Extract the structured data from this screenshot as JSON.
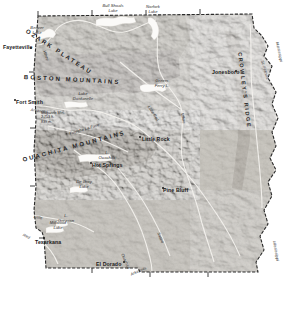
{
  "map": {
    "title": "Arkansas Topography",
    "state_name": "Arkansas",
    "cities": [
      {
        "name": "Fayetteville",
        "x": 3,
        "y": 45,
        "dot_x": 30,
        "dot_y": 47
      },
      {
        "name": "Fort Smith",
        "x": 16,
        "y": 100,
        "dot_x": 14,
        "dot_y": 99
      },
      {
        "name": "Jonesboro",
        "x": 212,
        "y": 70,
        "dot_x": 235,
        "dot_y": 70
      },
      {
        "name": "Little Rock",
        "x": 142,
        "y": 137,
        "dot_x": 139,
        "dot_y": 136
      },
      {
        "name": "Hot Springs",
        "x": 92,
        "y": 163,
        "dot_x": 90,
        "dot_y": 162
      },
      {
        "name": "Pine Bluff",
        "x": 163,
        "y": 188,
        "dot_x": 162,
        "dot_y": 187
      },
      {
        "name": "Texarkana",
        "x": 35,
        "y": 240,
        "dot_x": 43,
        "dot_y": 237
      },
      {
        "name": "El Dorado",
        "x": 96,
        "y": 262,
        "dot_x": 123,
        "dot_y": 261
      }
    ],
    "regions": [
      {
        "name": "OZARK PLATEAU",
        "x": 28,
        "y": 28,
        "rot": 33,
        "size": "lg"
      },
      {
        "name": "BOSTON MOUNTAINS",
        "x": 24,
        "y": 74,
        "rot": 3,
        "size": "lg"
      },
      {
        "name": "OUACHITA MOUNTAINS",
        "x": 22,
        "y": 157,
        "rot": -15,
        "size": "lg"
      },
      {
        "name": "CROWLEY'S RIDGE",
        "x": 242,
        "y": 52,
        "rot": 83,
        "size": "sm"
      }
    ],
    "lakes": [
      {
        "name": "Bull Shoals\nLake",
        "x": 96,
        "y": 4,
        "w": 34
      },
      {
        "name": "Norfork\nLake",
        "x": 140,
        "y": 5,
        "w": 26
      },
      {
        "name": "Beaver\nLake",
        "x": 24,
        "y": 26,
        "w": 26
      },
      {
        "name": "Lake\nDardanelle",
        "x": 66,
        "y": 92,
        "w": 34
      },
      {
        "name": "Greers\nFerry L.",
        "x": 148,
        "y": 79,
        "w": 28
      },
      {
        "name": "L.\nOuachita",
        "x": 95,
        "y": 151,
        "w": 24
      },
      {
        "name": "De Gray\nLake",
        "x": 72,
        "y": 180,
        "w": 24
      },
      {
        "name": "L.\nGreeson",
        "x": 56,
        "y": 214,
        "w": 20
      },
      {
        "name": "Millwood\nLake",
        "x": 44,
        "y": 221,
        "w": 28
      }
    ],
    "rivers": [
      {
        "name": "White",
        "x": 46,
        "y": 50,
        "rot": 72
      },
      {
        "name": "White",
        "x": 184,
        "y": 113,
        "rot": 80
      },
      {
        "name": "Arkansas",
        "x": 31,
        "y": 108,
        "rot": 8
      },
      {
        "name": "Arkansas",
        "x": 130,
        "y": 273,
        "rot": -25
      },
      {
        "name": "Fourche La Fave",
        "x": 69,
        "y": 132,
        "rot": -17
      },
      {
        "name": "Little Red",
        "x": 150,
        "y": 105,
        "rot": 57
      },
      {
        "name": "St. Francis",
        "x": 264,
        "y": 60,
        "rot": 74
      },
      {
        "name": "Mississippi",
        "x": 279,
        "y": 42,
        "rot": 78
      },
      {
        "name": "Mississippi",
        "x": 276,
        "y": 241,
        "rot": 80
      },
      {
        "name": "Ouachita",
        "x": 124,
        "y": 253,
        "rot": 67
      },
      {
        "name": "Saline",
        "x": 160,
        "y": 232,
        "rot": 68
      },
      {
        "name": "Red",
        "x": 24,
        "y": 233,
        "rot": 28
      },
      {
        "name": "Little",
        "x": 34,
        "y": 215,
        "rot": 8
      }
    ],
    "peak": {
      "name": "Magazine Mtn.",
      "elev_ft": "2,753 ft.",
      "elev_m": "839 m.",
      "x": 41,
      "y": 111
    }
  },
  "legend": {
    "title": "TOPOGRAPHY",
    "below_sea_level": "Below\nsea\nlevel",
    "sea_level": "Sea\nLevel",
    "steps": [
      {
        "m": "100 m.",
        "ft": "328 ft.",
        "color": "#d8d5cf",
        "w": 20
      },
      {
        "m": "200 m.",
        "ft": "656 ft.",
        "color": "#c6c2ba",
        "w": 20
      },
      {
        "m": "500 m.",
        "ft": "1,640 ft.",
        "color": "#b2ada3",
        "w": 20
      },
      {
        "m": "1,000 m.",
        "ft": "3,281 ft.",
        "color": "#9d978c",
        "w": 20
      },
      {
        "m": "2,000 m.",
        "ft": "6,562 ft.",
        "color": "#857f74",
        "w": 20
      },
      {
        "m": "3,000 m.",
        "ft": "10,000 ft.",
        "color": "#6e685e",
        "w": 20
      }
    ]
  },
  "colors": {
    "lowland": "#b8b4ac",
    "upland": "#9a958b",
    "highland": "#7e786e",
    "water": "#ffffff",
    "border": "#2a2a2a",
    "background": "#ffffff"
  }
}
